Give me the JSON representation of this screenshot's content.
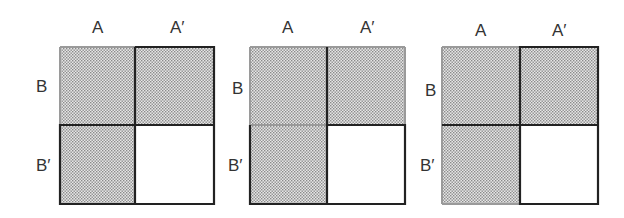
{
  "diagrams": [
    {
      "col_labels": [
        "A",
        "A′"
      ],
      "row_labels": [
        "B",
        "B′"
      ],
      "shaded": [
        "A∩B",
        "A′∩B",
        "A∩B′"
      ],
      "unshaded": [
        "A′∩B′"
      ],
      "highlight": "A′ ∪ B′ outlined dark"
    },
    {
      "col_labels": [
        "A",
        "A′"
      ],
      "row_labels": [
        "B",
        "B′"
      ],
      "shaded": [
        "A∩B",
        "A′∩B",
        "A∩B′"
      ],
      "unshaded": [
        "A′∩B′"
      ],
      "highlight": "column divider and B′ row outlined dark"
    },
    {
      "col_labels": [
        "A",
        "A′"
      ],
      "row_labels": [
        "B",
        "B′"
      ],
      "shaded": [
        "A∩B",
        "A′∩B",
        "A∩B′"
      ],
      "unshaded": [
        "A′∩B′"
      ],
      "highlight": "row divider and A′ column outlined dark"
    }
  ],
  "colors": {
    "shade": "#c8c8c8",
    "dark_line": "#222222",
    "light_line": "#9a9a9a"
  }
}
